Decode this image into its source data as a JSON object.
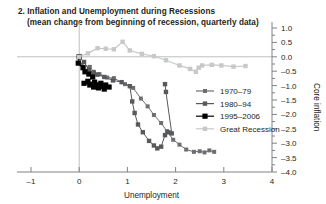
{
  "chart_data": {
    "type": "line",
    "title": "2.  Inflation and Unemployment during Recessions",
    "subtitle": "(mean change from beginning of recession, quarterly data)",
    "xlabel": "Unemployment",
    "ylabel": "Core inflation",
    "xlim": [
      -1,
      4
    ],
    "ylim": [
      -4.0,
      1.0
    ],
    "xticks": [
      "-1",
      "0",
      "1",
      "2",
      "3",
      "4"
    ],
    "xtick_values": [
      -1,
      0,
      1,
      2,
      3,
      4
    ],
    "yticks": [
      "1.0",
      "0.5",
      "0.0",
      "-0.5",
      "-1.0",
      "-1.5",
      "-2.0",
      "-2.5",
      "-3.0",
      "-3.5",
      "-4.0"
    ],
    "ytick_values": [
      1.0,
      0.5,
      0.0,
      -0.5,
      -1.0,
      -1.5,
      -2.0,
      -2.5,
      -3.0,
      -3.5,
      -4.0
    ],
    "grid": false,
    "legend_position": "right-middle",
    "zero_lines": {
      "x": 0,
      "y": 0
    },
    "series": [
      {
        "name": "1970–79",
        "color": "#6d6e71",
        "marker": "square",
        "marker_size": 4.0,
        "points": [
          [
            0.0,
            0.0
          ],
          [
            0.05,
            -0.28
          ],
          [
            0.22,
            -0.35
          ],
          [
            0.3,
            -0.52
          ],
          [
            0.42,
            -0.6
          ],
          [
            0.58,
            -0.72
          ],
          [
            0.72,
            -0.74
          ],
          [
            0.95,
            -0.95
          ],
          [
            1.12,
            -1.08
          ],
          [
            1.28,
            -1.45
          ],
          [
            1.42,
            -1.72
          ],
          [
            1.55,
            -2.02
          ],
          [
            1.7,
            -2.3
          ],
          [
            1.82,
            -2.58
          ],
          [
            1.95,
            -2.88
          ],
          [
            2.08,
            -3.05
          ],
          [
            2.22,
            -3.22
          ],
          [
            2.38,
            -3.3
          ],
          [
            2.5,
            -3.28
          ],
          [
            2.6,
            -3.32
          ],
          [
            2.7,
            -3.25
          ],
          [
            2.8,
            -3.3
          ]
        ]
      },
      {
        "name": "1980–94",
        "color": "#58595b",
        "marker": "square",
        "marker_size": 4.4,
        "points": [
          [
            0.0,
            0.0
          ],
          [
            0.1,
            -0.18
          ],
          [
            0.2,
            -0.45
          ],
          [
            0.3,
            -0.55
          ],
          [
            0.38,
            -0.62
          ],
          [
            0.52,
            -0.7
          ],
          [
            0.7,
            -0.82
          ],
          [
            0.88,
            -0.88
          ],
          [
            1.05,
            -1.02
          ],
          [
            1.1,
            -1.55
          ],
          [
            1.15,
            -1.95
          ],
          [
            1.22,
            -2.35
          ],
          [
            1.32,
            -2.62
          ],
          [
            1.45,
            -2.92
          ],
          [
            1.55,
            -3.08
          ],
          [
            1.62,
            -3.18
          ],
          [
            1.7,
            -3.12
          ],
          [
            1.78,
            -2.72
          ],
          [
            1.85,
            -2.62
          ],
          [
            1.92,
            -2.66
          ],
          [
            1.8,
            -1.22
          ],
          [
            1.78,
            -0.95
          ]
        ]
      },
      {
        "name": "1995–2006",
        "color": "#000000",
        "marker": "square",
        "marker_size": 5.2,
        "points": [
          [
            0.0,
            0.0
          ],
          [
            -0.02,
            -0.22
          ],
          [
            0.08,
            -0.38
          ],
          [
            0.12,
            -0.52
          ],
          [
            0.2,
            -0.6
          ],
          [
            0.28,
            -0.7
          ],
          [
            0.18,
            -0.85
          ],
          [
            0.1,
            -0.92
          ],
          [
            0.22,
            -0.98
          ],
          [
            0.35,
            -1.0
          ],
          [
            0.45,
            -1.02
          ],
          [
            0.55,
            -0.98
          ],
          [
            0.62,
            -1.05
          ],
          [
            0.52,
            -1.12
          ],
          [
            0.4,
            -1.08
          ],
          [
            0.3,
            -1.05
          ],
          [
            0.24,
            -0.95
          ],
          [
            0.32,
            -0.88
          ],
          [
            0.45,
            -0.92
          ]
        ]
      },
      {
        "name": "Great Recession",
        "color": "#c7c8ca",
        "marker": "square",
        "marker_size": 4.4,
        "points": [
          [
            0.0,
            0.0
          ],
          [
            0.18,
            0.12
          ],
          [
            0.38,
            0.3
          ],
          [
            0.55,
            0.28
          ],
          [
            0.72,
            0.26
          ],
          [
            0.9,
            0.52
          ],
          [
            1.05,
            0.22
          ],
          [
            1.3,
            0.1
          ],
          [
            1.55,
            0.02
          ],
          [
            1.8,
            -0.12
          ],
          [
            2.08,
            -0.3
          ],
          [
            2.3,
            -0.42
          ],
          [
            2.42,
            -0.52
          ],
          [
            2.48,
            -0.38
          ],
          [
            2.55,
            -0.3
          ],
          [
            2.75,
            -0.28
          ],
          [
            2.95,
            -0.3
          ],
          [
            3.2,
            -0.34
          ],
          [
            3.45,
            -0.32
          ]
        ]
      }
    ]
  },
  "legend": {
    "entries": [
      {
        "label": "1970–79"
      },
      {
        "label": "1980–94"
      },
      {
        "label": "1995–2006"
      },
      {
        "label": "Great Recession"
      }
    ]
  }
}
